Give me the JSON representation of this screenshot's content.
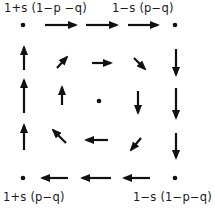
{
  "colors": {
    "ink": "#111111",
    "background": "#ffffff"
  },
  "labels": {
    "top_left": "1+s (1−p −q)",
    "top_right": "1−s (p−q)",
    "bottom_left": "1+s (p−q)",
    "bottom_right": "1−s (1−p−q)"
  },
  "label_positions": {
    "top_left": {
      "x": 4,
      "y": 2
    },
    "top_right": {
      "x": 112,
      "y": 2
    },
    "bottom_left": {
      "x": 3,
      "y": 191
    },
    "bottom_right": {
      "x": 133,
      "y": 191
    }
  },
  "dots": [
    {
      "name": "corner-top-left-dot",
      "x": 23,
      "y": 25,
      "r": 2.3
    },
    {
      "name": "corner-top-right-dot",
      "x": 175,
      "y": 25,
      "r": 2.3
    },
    {
      "name": "corner-bottom-left-dot",
      "x": 23,
      "y": 178,
      "r": 2.3
    },
    {
      "name": "corner-bottom-right-dot",
      "x": 175,
      "y": 178,
      "r": 2.3
    },
    {
      "name": "center-dot",
      "x": 99,
      "y": 101,
      "r": 2.3
    }
  ],
  "arrows": [
    {
      "name": "outer-top-arrow-1",
      "direction": "right",
      "x1": 45,
      "y1": 25,
      "x2": 76,
      "y2": 25
    },
    {
      "name": "outer-top-arrow-2",
      "direction": "right",
      "x1": 86,
      "y1": 25,
      "x2": 117,
      "y2": 25
    },
    {
      "name": "outer-top-arrow-3",
      "direction": "right",
      "x1": 128,
      "y1": 25,
      "x2": 158,
      "y2": 25
    },
    {
      "name": "outer-right-arrow-1",
      "direction": "down",
      "x1": 176,
      "y1": 49,
      "x2": 176,
      "y2": 75
    },
    {
      "name": "outer-right-arrow-2",
      "direction": "down",
      "x1": 176,
      "y1": 88,
      "x2": 176,
      "y2": 118
    },
    {
      "name": "outer-right-arrow-3",
      "direction": "down",
      "x1": 176,
      "y1": 133,
      "x2": 176,
      "y2": 158
    },
    {
      "name": "outer-bottom-arrow-1",
      "direction": "left",
      "x1": 150,
      "y1": 178,
      "x2": 124,
      "y2": 178
    },
    {
      "name": "outer-bottom-arrow-2",
      "direction": "left",
      "x1": 111,
      "y1": 178,
      "x2": 82,
      "y2": 178
    },
    {
      "name": "outer-bottom-arrow-3",
      "direction": "left",
      "x1": 68,
      "y1": 178,
      "x2": 42,
      "y2": 178
    },
    {
      "name": "outer-left-arrow-1",
      "direction": "up",
      "x1": 24,
      "y1": 150,
      "x2": 24,
      "y2": 125
    },
    {
      "name": "outer-left-arrow-2",
      "direction": "up",
      "x1": 24,
      "y1": 113,
      "x2": 24,
      "y2": 80
    },
    {
      "name": "outer-left-arrow-3",
      "direction": "up",
      "x1": 24,
      "y1": 70,
      "x2": 24,
      "y2": 47
    },
    {
      "name": "inner-top-left-arrow",
      "direction": "up-right",
      "x1": 57,
      "y1": 68,
      "x2": 67,
      "y2": 57
    },
    {
      "name": "inner-top-arrow",
      "direction": "right",
      "x1": 92,
      "y1": 63,
      "x2": 111,
      "y2": 63
    },
    {
      "name": "inner-top-right-arrow",
      "direction": "down-right",
      "x1": 134,
      "y1": 58,
      "x2": 145,
      "y2": 69
    },
    {
      "name": "inner-right-arrow",
      "direction": "down",
      "x1": 138,
      "y1": 91,
      "x2": 138,
      "y2": 113
    },
    {
      "name": "inner-bottom-right-arrow",
      "direction": "down-left",
      "x1": 141,
      "y1": 138,
      "x2": 131,
      "y2": 150
    },
    {
      "name": "inner-bottom-arrow",
      "direction": "left",
      "x1": 108,
      "y1": 140,
      "x2": 86,
      "y2": 140
    },
    {
      "name": "inner-bottom-left-arrow",
      "direction": "up-left",
      "x1": 66,
      "y1": 143,
      "x2": 53,
      "y2": 130
    },
    {
      "name": "inner-left-arrow",
      "direction": "up",
      "x1": 62,
      "y1": 105,
      "x2": 62,
      "y2": 87
    }
  ]
}
